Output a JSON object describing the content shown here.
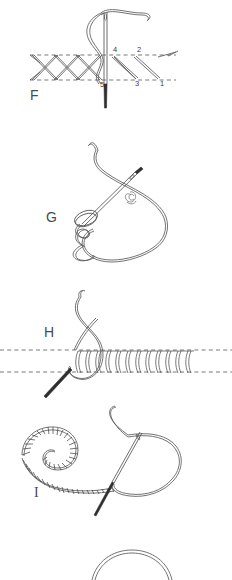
{
  "page": {
    "kind": "embroidery-stitch-instruction-diagram",
    "background_color": "#ffffff",
    "ink_color": "#4a4a4a",
    "width": 232,
    "height": 580
  },
  "figures": [
    {
      "id": "F",
      "label": "F",
      "label_x": 30,
      "label_y": 100,
      "title": "herringbone / cross stitch with numbered entry points",
      "numbers": [
        {
          "text": "1",
          "x": 160,
          "y": 86
        },
        {
          "text": "2",
          "x": 137,
          "y": 52
        },
        {
          "text": "3",
          "x": 135,
          "y": 86
        },
        {
          "text": "4",
          "x": 113,
          "y": 52
        },
        {
          "text": "5",
          "x": 102,
          "y": 87
        }
      ],
      "guides": [
        {
          "y": 55,
          "x1": 30,
          "x2": 176
        },
        {
          "y": 80,
          "x1": 30,
          "x2": 176
        }
      ]
    },
    {
      "id": "G",
      "label": "G",
      "label_x": 46,
      "label_y": 222,
      "title": "knotted loop stitch with needle"
    },
    {
      "id": "H",
      "label": "H",
      "label_x": 44,
      "label_y": 337,
      "title": "closed buttonhole / blanket stitch row",
      "guides": [
        {
          "y": 350,
          "x1": 0,
          "x2": 232
        },
        {
          "y": 372,
          "x1": 0,
          "x2": 232
        }
      ]
    },
    {
      "id": "I",
      "label": "I",
      "label_x": 38,
      "label_y": 497,
      "title": "spiral buttonhole stitch with needle and thread loop"
    },
    {
      "id": "partial",
      "label": "",
      "title": "partial thread loop arc at page bottom"
    }
  ],
  "colors": {
    "ink": "#4a4a4a",
    "ink_dark": "#2e2e2e",
    "guide": "#555555",
    "background": "#ffffff"
  }
}
